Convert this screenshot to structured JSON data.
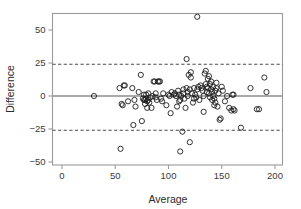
{
  "chart_data": {
    "type": "scatter",
    "title": "",
    "xlabel": "Average",
    "ylabel": "Difference",
    "xlim": [
      0,
      205
    ],
    "ylim": [
      -57,
      62
    ],
    "xticks": [
      0,
      50,
      100,
      150,
      200
    ],
    "xticklabels": [
      "0",
      "50",
      "100",
      "150",
      "200"
    ],
    "yticks": [
      -50,
      -25,
      0,
      25,
      50
    ],
    "yticklabels": [
      "−50",
      "−25",
      "0",
      "25",
      "50"
    ],
    "grid": false,
    "legend": null,
    "reference_lines": [
      {
        "name": "mean-difference",
        "y": 0,
        "style": "solid",
        "color": "#8c8c8c"
      },
      {
        "name": "upper-limit-of-agreement",
        "y": 24,
        "style": "dashed",
        "color": "#4a4a4a"
      },
      {
        "name": "lower-limit-of-agreement",
        "y": -26,
        "style": "dashed",
        "color": "#4a4a4a"
      }
    ],
    "marker": {
      "shape": "circle-open",
      "radius": 2.6,
      "edge_color": "#1d1d1d"
    },
    "points": [
      [
        30,
        0
      ],
      [
        54,
        6
      ],
      [
        55,
        -40
      ],
      [
        56,
        -6
      ],
      [
        57,
        -7
      ],
      [
        58,
        8
      ],
      [
        59,
        8
      ],
      [
        62,
        -4
      ],
      [
        66,
        6
      ],
      [
        67,
        -22
      ],
      [
        68,
        -3
      ],
      [
        69,
        -8
      ],
      [
        72,
        3
      ],
      [
        74,
        16
      ],
      [
        75,
        -19
      ],
      [
        76,
        -2
      ],
      [
        77,
        -3
      ],
      [
        77,
        1
      ],
      [
        78,
        -3
      ],
      [
        78,
        -6
      ],
      [
        79,
        1
      ],
      [
        79,
        -2
      ],
      [
        80,
        -4
      ],
      [
        80,
        -9
      ],
      [
        81,
        2
      ],
      [
        81,
        -3
      ],
      [
        82,
        -5
      ],
      [
        83,
        -1
      ],
      [
        84,
        -9
      ],
      [
        85,
        0
      ],
      [
        86,
        11
      ],
      [
        87,
        11
      ],
      [
        88,
        -1
      ],
      [
        88,
        2
      ],
      [
        89,
        -3
      ],
      [
        90,
        11
      ],
      [
        91,
        11
      ],
      [
        92,
        11
      ],
      [
        93,
        -2
      ],
      [
        94,
        -4
      ],
      [
        95,
        2
      ],
      [
        98,
        -7
      ],
      [
        100,
        1
      ],
      [
        101,
        0
      ],
      [
        102,
        -13
      ],
      [
        103,
        3
      ],
      [
        105,
        1
      ],
      [
        106,
        2
      ],
      [
        107,
        0
      ],
      [
        108,
        -8
      ],
      [
        109,
        4
      ],
      [
        110,
        1
      ],
      [
        110,
        -4
      ],
      [
        111,
        -42
      ],
      [
        111,
        -3
      ],
      [
        112,
        0
      ],
      [
        113,
        -27
      ],
      [
        114,
        2
      ],
      [
        114,
        5
      ],
      [
        115,
        -2
      ],
      [
        116,
        -9
      ],
      [
        117,
        6
      ],
      [
        117,
        28
      ],
      [
        118,
        3
      ],
      [
        118,
        0
      ],
      [
        119,
        16
      ],
      [
        120,
        5
      ],
      [
        120,
        -35
      ],
      [
        121,
        18
      ],
      [
        121,
        14
      ],
      [
        122,
        2
      ],
      [
        123,
        -5
      ],
      [
        124,
        -2
      ],
      [
        124,
        6
      ],
      [
        125,
        1
      ],
      [
        126,
        -1
      ],
      [
        127,
        60
      ],
      [
        127,
        5
      ],
      [
        128,
        7
      ],
      [
        129,
        -3
      ],
      [
        130,
        8
      ],
      [
        131,
        6
      ],
      [
        132,
        4
      ],
      [
        133,
        0
      ],
      [
        133,
        -12
      ],
      [
        134,
        17
      ],
      [
        135,
        19
      ],
      [
        135,
        9
      ],
      [
        136,
        7
      ],
      [
        136,
        3
      ],
      [
        137,
        13
      ],
      [
        137,
        6
      ],
      [
        138,
        15
      ],
      [
        138,
        2
      ],
      [
        139,
        9
      ],
      [
        139,
        -1
      ],
      [
        140,
        11
      ],
      [
        140,
        5
      ],
      [
        141,
        3
      ],
      [
        141,
        -3
      ],
      [
        142,
        7
      ],
      [
        142,
        0
      ],
      [
        143,
        -2
      ],
      [
        143,
        -7
      ],
      [
        144,
        4
      ],
      [
        144,
        -5
      ],
      [
        145,
        10
      ],
      [
        145,
        6
      ],
      [
        146,
        -8
      ],
      [
        147,
        2
      ],
      [
        148,
        -18
      ],
      [
        149,
        -17
      ],
      [
        150,
        7
      ],
      [
        151,
        4
      ],
      [
        153,
        -4
      ],
      [
        155,
        0
      ],
      [
        157,
        -9
      ],
      [
        159,
        -11
      ],
      [
        160,
        1
      ],
      [
        161,
        1
      ],
      [
        161,
        -10
      ],
      [
        162,
        -11
      ],
      [
        168,
        -24
      ],
      [
        177,
        6
      ],
      [
        183,
        -10
      ],
      [
        185,
        -10
      ],
      [
        190,
        14
      ],
      [
        192,
        3
      ]
    ]
  },
  "axes": {
    "x_title": "Average",
    "y_title": "Difference"
  }
}
